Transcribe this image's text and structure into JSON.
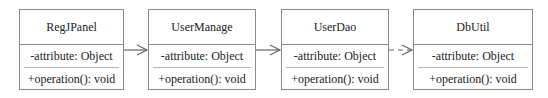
{
  "diagram": {
    "type": "uml-class-dependency-chain",
    "classes": [
      {
        "name": "RegJPanel",
        "attribute": "-attribute: Object",
        "operation": "+operation(): void"
      },
      {
        "name": "UserManage",
        "attribute": "-attribute: Object",
        "operation": "+operation(): void"
      },
      {
        "name": "UserDao",
        "attribute": "-attribute: Object",
        "operation": "+operation(): void"
      },
      {
        "name": "DbUtil",
        "attribute": "-attribute: Object",
        "operation": "+operation(): void"
      }
    ],
    "relations": [
      {
        "from": "RegJPanel",
        "to": "UserManage",
        "style": "solid",
        "head": "open-arrow"
      },
      {
        "from": "UserManage",
        "to": "UserDao",
        "style": "solid",
        "head": "open-arrow"
      },
      {
        "from": "UserDao",
        "to": "DbUtil",
        "style": "dashed",
        "head": "open-arrow"
      }
    ],
    "colors": {
      "border": "#8a8a8a",
      "separator": "#b5b5b5",
      "line": "#666666",
      "text": "#222222"
    }
  }
}
